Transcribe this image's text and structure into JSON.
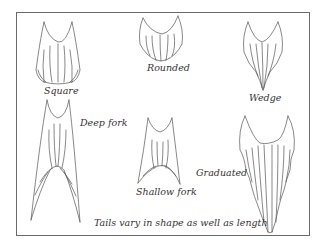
{
  "caption": "Tails vary in shape as well as length",
  "tails": [
    {
      "id": "square",
      "label": "Square"
    },
    {
      "id": "rounded",
      "label": "Rounded"
    },
    {
      "id": "wedge",
      "label": "Wedge"
    },
    {
      "id": "deep-fork",
      "label": "Deep fork"
    },
    {
      "id": "shallow-fork",
      "label": "Shallow fork"
    },
    {
      "id": "graduated",
      "label": "Graduated"
    }
  ]
}
